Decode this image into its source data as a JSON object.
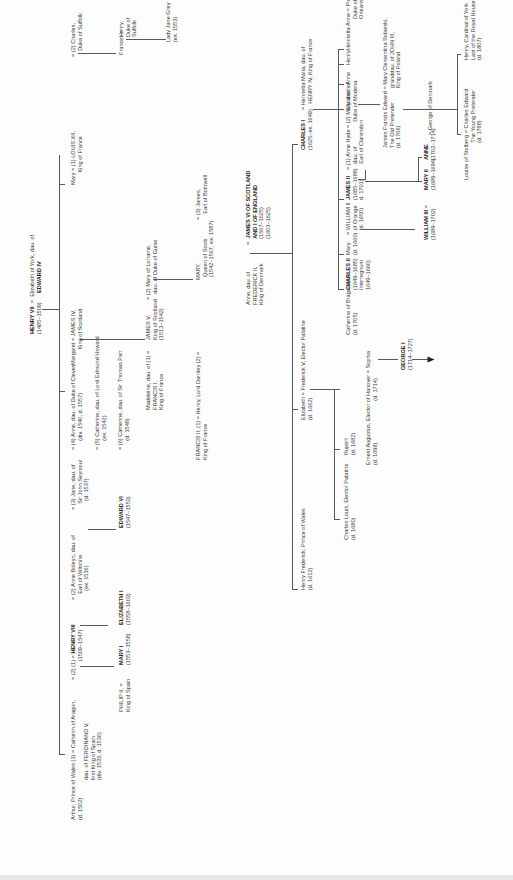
{
  "nodes": {
    "henry7": {
      "name": "HENRY VII",
      "dates": "(1485–1509)"
    },
    "elizabeth_york": {
      "line1": "Elizabeth of York, dau. of",
      "line2": "EDWARD IV"
    },
    "arthur": {
      "line1": "Arthur, Prince of Wales (1) = Catherin of Aragon,",
      "line2": "(d. 1502)"
    },
    "catherine_aragon": {
      "line1": "dau. of FERDINAND V,",
      "line2": "first King of Spain",
      "line3": "(div. 1533, d. 1536)"
    },
    "henry8_prefix": "= (2) (1) =",
    "henry8": {
      "name": "HENRY VIII",
      "dates": "(1509–1547)"
    },
    "anne_boleyn": {
      "line1": "= (2) Anne Boleyn, dau. of",
      "line2": "Earl of Wiltshire",
      "line3": "(ex. 1536)"
    },
    "jane_seymour": {
      "line1": "= (3) Jane, dau. of",
      "line2": "Sir John Seymour",
      "line3": "(d. 1537)"
    },
    "anne_cleves": {
      "line1": "= (4) Anne, dau. of Duke of Cleves",
      "line2": "(div. 1540, d. 1557)"
    },
    "catherine_howard": {
      "line1": "= (5) Catherine, dau. of Lord Edmund Howard",
      "line2": "(ex. 1542)"
    },
    "catherine_parr": {
      "line1": "= (6) Catherine, dau. of Sir Thomas Parr",
      "line2": "(d. 1548)"
    },
    "philip2": {
      "line1": "PHILIP II,   =",
      "line2": "King of Spain"
    },
    "mary1": {
      "name": "MARY I",
      "dates": "(1553–1558)"
    },
    "elizabeth1": {
      "name": "ELIZABETH I",
      "dates": "(1558–1603)"
    },
    "edward6": {
      "name": "EDWARD VI",
      "dates": "(1547–1553)"
    },
    "margaret": {
      "line1": "Margaret = JAMES IV,",
      "line2": "King of Scotland"
    },
    "mary_tudor": {
      "line1": "Mary = (1) LOUIS XII,",
      "line2": "King of France"
    },
    "charles_suffolk": {
      "line1": "= (2) Charles,",
      "line2": "Duke of Suffolk"
    },
    "frances": "Frances =",
    "henry_suffolk": {
      "line1": "Henry,",
      "line2": "Duke of",
      "line3": "Suffolk"
    },
    "lady_jane_grey": {
      "line1": "Lady Jane Grey",
      "line2": "(ex. 1553)"
    },
    "madeleine": {
      "line1": "Madeleine, dau. of (1) =",
      "line2": "FRANCIS I,",
      "line3": "King of France"
    },
    "james5": {
      "line1": "JAMES V,",
      "line2": "King of Scotland",
      "line3": "(1513–1542)"
    },
    "mary_lorraine": {
      "line1": "= (2) Mary of Lorraine,",
      "line2": "dau. of Duke of Guise"
    },
    "francis2": {
      "line1": "FRANCIS II,   (1) =   Henry, Lord Darnley (2) =",
      "line2": "King of France"
    },
    "mary_scots": {
      "line1": "MARY,",
      "line2": "Queen of Scots",
      "line3": "(1542–1567, ex. 1587)"
    },
    "bothwell": {
      "line1": "= (3) James,",
      "line2": "Earl of Bothwell"
    },
    "anne_denmark": {
      "line1": "Anne, dau. of",
      "line2": "FREDERICK II,",
      "line3": "King of Denmark"
    },
    "james1": {
      "eq": "=",
      "line1": "JAMES VI OF SCOTLAND",
      "line2": "AND I OF ENGLAND",
      "line3": "(1567–1625)",
      "line4": "(1603–1625)"
    },
    "henry_frederick": {
      "line1": "Henry Frederick, Prince of Wales",
      "line2": "(d. 1612)"
    },
    "elizabeth_bohemia": {
      "line1": "Elizabeth = Frederick V, Elector Palatine",
      "line2": "(d. 1662)"
    },
    "charles1": {
      "name": "CHARLES I",
      "dates": "(1625–ex. 1649)"
    },
    "henrietta_maria": {
      "line1": "=   Henrietta Maria, dau. of",
      "line2": "HENRY IV, King of France"
    },
    "charles_louis": {
      "line1": "Charles Louis, Elector Palatine",
      "line2": "(d. 1680)"
    },
    "rupert": {
      "line1": "Rupert",
      "line2": "(d. 1682)"
    },
    "ernest_augustus": {
      "line1": "Ernest Augustus, Elector of Hanover = Sophia",
      "line2": "(d. 1698)",
      "line3": "(d. 1714)"
    },
    "george1": {
      "name": "GEORGE I",
      "dates": "(1714–1727)"
    },
    "catherine_braganza": {
      "line1": "Catherine of Braganza =",
      "line2": "(d. 1705)"
    },
    "charles2": {
      "name": "CHARLES II",
      "line2": "(1649–1685)",
      "line3": "Interregnum",
      "line4": "1649–1660)"
    },
    "mary_orange": {
      "line1": "Mary",
      "line2": "(d. 1660)"
    },
    "william2": {
      "line1": "=   WILLIAM II",
      "line2": "of Orange",
      "line3": "(d. 1650)"
    },
    "james2": {
      "name": "JAMES II",
      "line2": "(1685–1688)",
      "line3": "d. 1701)"
    },
    "anne_hyde": {
      "line1": "= (1) Anne Hyde",
      "line2": "dau. of",
      "line3": "Earl of Clarendon"
    },
    "mary_modena": {
      "line1": "= (2) Mary, dau. of",
      "line2": "Duke of Modena"
    },
    "elizabeth_c1": "Elizabeth",
    "anne_c1": "Anne",
    "henry_c1": "Henry",
    "henrietta_anne": {
      "line1": "Henrietta Anne =",
      "line2": "Philip,",
      "line3": "Duke of",
      "line4": "Orleans"
    },
    "william3": {
      "name": "WILLIAM III",
      "eq": "=",
      "dates": "(1689–1702)"
    },
    "mary2": {
      "name": "MARY II",
      "dates": "(1689–1694)"
    },
    "anne_queen": {
      "name": "ANNE",
      "dates": "(1702–1714)",
      "spouse": "= George of Denmark"
    },
    "old_pretender": {
      "line1": "James Francis Edward = Mary Clementina Sobieski,",
      "line2": "The Old Pretender",
      "line3": "(d. 1766)",
      "s2": "granddau. of JOHN III,",
      "s3": "King of Poland"
    },
    "young_pretender": {
      "line1": "Louise of Stolberg = Charles Edward",
      "line2": "The Young Pretender",
      "line3": "(d. 1788)"
    },
    "cardinal_york": {
      "line1": "Henry, Cardinal of York",
      "line2": "Last of the Royal House of Stuart",
      "line3": "(d. 1807)"
    }
  }
}
